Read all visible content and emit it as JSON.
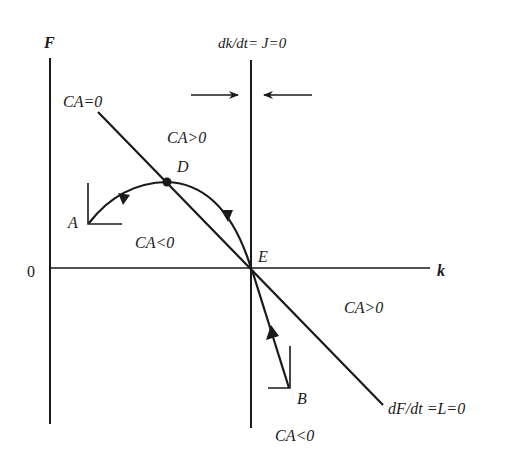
{
  "diagram": {
    "type": "phase-diagram",
    "axes": {
      "y_label": "F",
      "x_label": "k",
      "origin_label": "0"
    },
    "loci": {
      "vertical": "dk/dt= J=0",
      "downward_top_label": "CA=0",
      "downward_bottom_label": "dF/dt =L=0"
    },
    "regions": [
      {
        "label": "CA>0",
        "position": "upper-middle"
      },
      {
        "label": "CA<0",
        "position": "left-middle"
      },
      {
        "label": "CA>0",
        "position": "right-middle"
      },
      {
        "label": "CA<0",
        "position": "bottom"
      }
    ],
    "points": {
      "A": "A",
      "B": "B",
      "D": "D",
      "E": "E"
    },
    "colors": {
      "ink": "#1a1a1a",
      "background": "#ffffff"
    }
  }
}
